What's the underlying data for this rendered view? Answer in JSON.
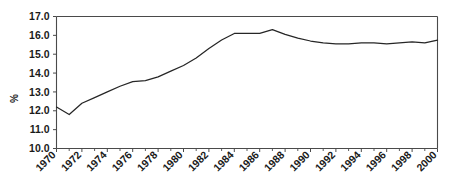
{
  "chart_data": {
    "type": "line",
    "title": "",
    "xlabel": "",
    "ylabel": "%",
    "ylim": [
      10.0,
      17.0
    ],
    "xlim": [
      1970,
      2000
    ],
    "grid": false,
    "legend": null,
    "y_ticks": [
      "10.0",
      "11.0",
      "12.0",
      "13.0",
      "14.0",
      "15.0",
      "16.0",
      "17.0"
    ],
    "y_tick_values": [
      10.0,
      11.0,
      12.0,
      13.0,
      14.0,
      15.0,
      16.0,
      17.0
    ],
    "x_ticks": [
      "1970",
      "1972",
      "1974",
      "1976",
      "1978",
      "1980",
      "1982",
      "1984",
      "1986",
      "1988",
      "1990",
      "1992",
      "1994",
      "1996",
      "1998",
      "2000"
    ],
    "x_tick_values": [
      1970,
      1972,
      1974,
      1976,
      1978,
      1980,
      1982,
      1984,
      1986,
      1988,
      1990,
      1992,
      1994,
      1996,
      1998,
      2000
    ],
    "x": [
      1970,
      1971,
      1972,
      1973,
      1974,
      1975,
      1976,
      1977,
      1978,
      1979,
      1980,
      1981,
      1982,
      1983,
      1984,
      1985,
      1986,
      1987,
      1988,
      1989,
      1990,
      1991,
      1992,
      1993,
      1994,
      1995,
      1996,
      1997,
      1998,
      1999,
      2000
    ],
    "values": [
      12.2,
      11.8,
      12.4,
      12.7,
      13.0,
      13.3,
      13.55,
      13.6,
      13.8,
      14.1,
      14.4,
      14.8,
      15.3,
      15.75,
      16.1,
      16.1,
      16.1,
      16.3,
      16.05,
      15.85,
      15.7,
      15.6,
      15.55,
      15.55,
      15.6,
      15.6,
      15.55,
      15.6,
      15.65,
      15.6,
      15.75
    ],
    "series": [
      {
        "name": "",
        "color": "#262626",
        "values": [
          12.2,
          11.8,
          12.4,
          12.7,
          13.0,
          13.3,
          13.55,
          13.6,
          13.8,
          14.1,
          14.4,
          14.8,
          15.3,
          15.75,
          16.1,
          16.1,
          16.1,
          16.3,
          16.05,
          15.85,
          15.7,
          15.6,
          15.55,
          15.55,
          15.6,
          15.6,
          15.55,
          15.6,
          15.65,
          15.6,
          15.75
        ]
      }
    ]
  },
  "colors": {
    "series": "#262626",
    "axis": "#4a4a4a",
    "text": "#1a1a1a",
    "background": "#ffffff"
  }
}
